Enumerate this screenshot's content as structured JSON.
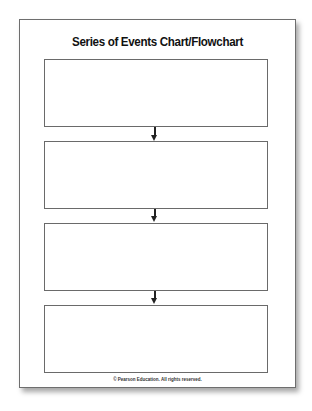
{
  "document": {
    "title": "Series of Events Chart/Flowchart",
    "boxes": [
      {
        "content": ""
      },
      {
        "content": ""
      },
      {
        "content": ""
      },
      {
        "content": ""
      }
    ],
    "arrow_icon": "arrow-down-icon",
    "footer": "© Pearson Education. All rights reserved."
  }
}
